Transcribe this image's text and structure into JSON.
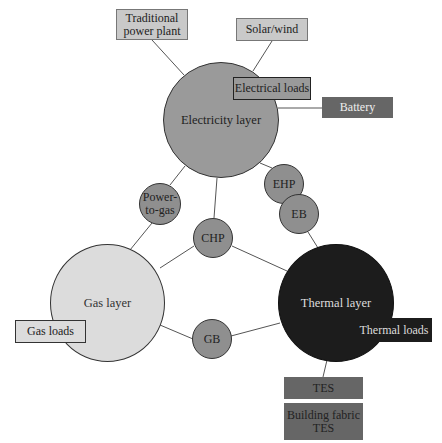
{
  "diagram": {
    "layers": {
      "electricity": {
        "label": "Electricity layer",
        "color": "#9a9a9a"
      },
      "gas": {
        "label": "Gas layer",
        "color": "#dcdcdc"
      },
      "thermal": {
        "label": "Thermal layer",
        "color": "#1c1c1c"
      }
    },
    "converters": {
      "power_to_gas": {
        "label": "Power-\nto-gas",
        "line1": "Power-",
        "line2": "to-gas"
      },
      "chp": {
        "label": "CHP"
      },
      "ehp": {
        "label": "EHP"
      },
      "eb": {
        "label": "EB"
      },
      "gb": {
        "label": "GB"
      }
    },
    "boxes": {
      "traditional_power_plant": {
        "line1": "Traditional",
        "line2": "power plant"
      },
      "solar_wind": {
        "label": "Solar/wind"
      },
      "electrical_loads": {
        "label": "Electrical loads"
      },
      "battery": {
        "label": "Battery"
      },
      "gas_loads": {
        "label": "Gas loads"
      },
      "thermal_loads": {
        "label": "Thermal loads"
      },
      "tes": {
        "label": "TES"
      },
      "building_fabric_tes": {
        "line1": "Building fabric",
        "line2": "TES"
      }
    },
    "colors": {
      "converter_fill": "#8f8f8f",
      "light_box_fill": "#c9c9c9",
      "dark_box_fill": "#666666",
      "edge": "#555555"
    }
  }
}
